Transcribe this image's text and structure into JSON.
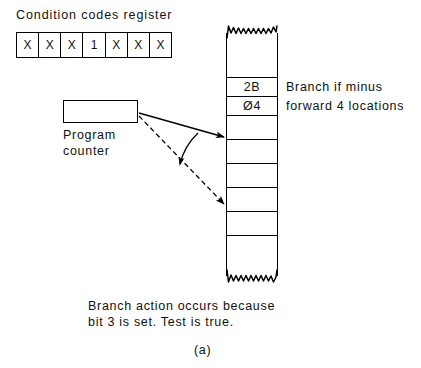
{
  "figure": {
    "label": "(a)",
    "caption_line_1": "Branch action occurs because",
    "caption_line_2": "bit 3 is set. Test is true."
  },
  "condition_codes_register": {
    "title": "Condition codes register",
    "bits": [
      "X",
      "X",
      "X",
      "1",
      "X",
      "X",
      "X"
    ],
    "set_bit_index": 3,
    "set_bit_value": "1"
  },
  "program_counter": {
    "label_line_1": "Program",
    "label_line_2": "counter",
    "value": ""
  },
  "memory": {
    "cells": [
      {
        "value": "",
        "label": ""
      },
      {
        "value": "2B",
        "label": "Branch if minus"
      },
      {
        "value": "Ø4",
        "label": "forward 4 locations"
      },
      {
        "value": "",
        "label": ""
      },
      {
        "value": "",
        "label": ""
      },
      {
        "value": "",
        "label": ""
      },
      {
        "value": "",
        "label": ""
      },
      {
        "value": "",
        "label": ""
      },
      {
        "value": "",
        "label": ""
      }
    ]
  },
  "colors": {
    "ink": "#000000",
    "paper": "#ffffff"
  }
}
